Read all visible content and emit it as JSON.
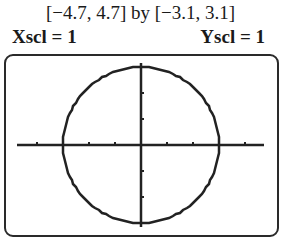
{
  "header": {
    "window_range": "[−4.7, 4.7] by [−3.1, 3.1]",
    "xscl": "Xscl = 1",
    "yscl": "Yscl = 1"
  },
  "chart_data": {
    "type": "line",
    "title": "[−4.7, 4.7] by [−3.1, 3.1]",
    "xlabel": "",
    "ylabel": "",
    "xlim": [
      -4.7,
      4.7
    ],
    "ylim": [
      -3.1,
      3.1
    ],
    "xscl": 1,
    "yscl": 1,
    "grid": false,
    "series": [
      {
        "name": "circle x^2 + y^2 = 9",
        "equation": "x^2 + y^2 = 9",
        "x": [
          3,
          2.12,
          0,
          -2.12,
          -3,
          -2.12,
          0,
          2.12,
          3
        ],
        "y": [
          0,
          2.12,
          3,
          2.12,
          0,
          -2.12,
          -3,
          -2.12,
          0
        ]
      }
    ],
    "x_ticks": [
      -4,
      -3,
      -2,
      -1,
      1,
      2,
      3,
      4
    ],
    "y_ticks": [
      -3,
      -2,
      -1,
      1,
      2,
      3
    ]
  }
}
